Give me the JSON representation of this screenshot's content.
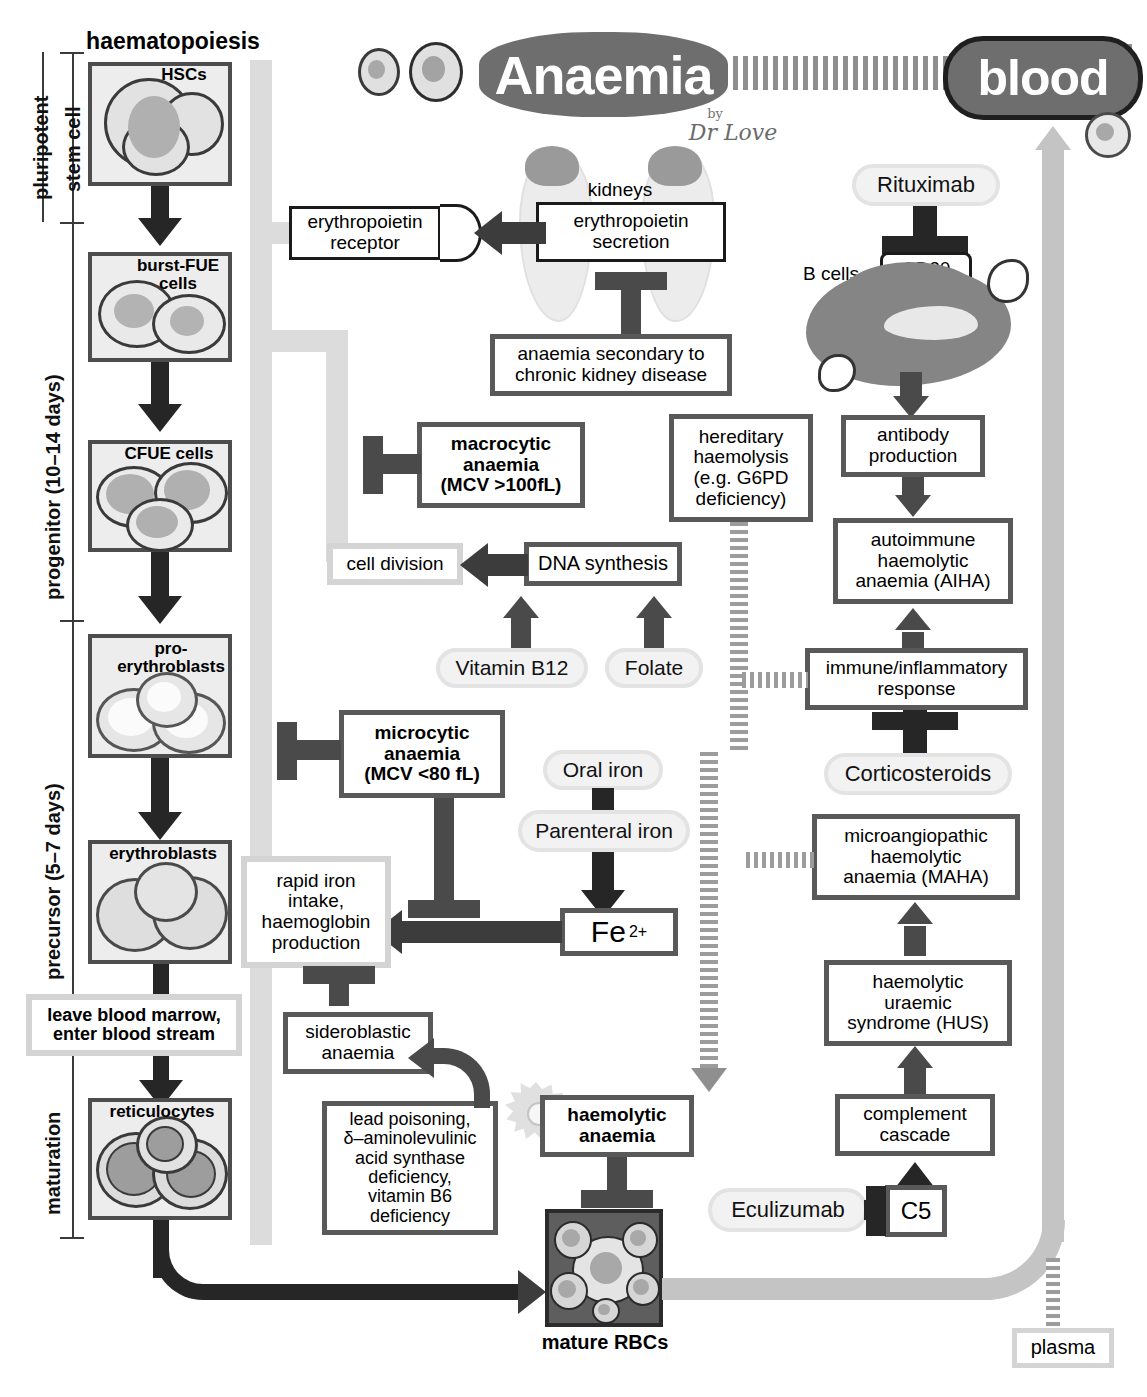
{
  "title": {
    "main": "Anaemia",
    "blood": "blood",
    "byline_small": "by",
    "byline_name": "Dr Love"
  },
  "headers": {
    "haematopoiesis": "haematopoiesis",
    "mature_rbcs": "mature RBCs",
    "plasma": "plasma"
  },
  "stages": [
    {
      "id": "pluripotent",
      "line1": "pluripotent",
      "line2": "stem cell"
    },
    {
      "id": "progenitor",
      "line1": "progenitor (10–14 days)"
    },
    {
      "id": "precursor",
      "line1": "precursor (5–7 days)"
    },
    {
      "id": "maturation",
      "line1": "maturation"
    }
  ],
  "cell_stages": [
    {
      "label": "HSCs"
    },
    {
      "label": "burst-FUE\ncells"
    },
    {
      "label": "CFUE cells"
    },
    {
      "label": "pro-\nerythroblasts"
    },
    {
      "label": "erythroblasts"
    },
    {
      "label": "reticulocytes"
    }
  ],
  "cell_labels": {
    "hscs": "HSCs",
    "burst_fue": "burst-FUE cells",
    "cfue": "CFUE cells",
    "pro_eryth": "pro- erythroblasts",
    "eryth": "erythroblasts",
    "retic": "reticulocytes"
  },
  "boxes": {
    "leave_marrow": "leave blood marrow,\nenter blood stream",
    "epo_receptor": "erythropoietin\nreceptor",
    "epo_secretion": "erythropoietin\nsecretion",
    "kidneys": "kidneys",
    "ckd": "anaemia secondary to\nchronic kidney disease",
    "macrocytic": "macrocytic\nanaemia\n(MCV >100fL)",
    "cell_division": "cell division",
    "dna_synthesis": "DNA synthesis",
    "vitamin_b12": "Vitamin B12",
    "folate": "Folate",
    "microcytic": "microcytic\nanaemia\n(MCV <80 fL)",
    "oral_iron": "Oral iron",
    "parenteral_iron": "Parenteral iron",
    "fe2": "Fe 2+",
    "rapid_iron": "rapid iron\nintake,\nhaemoglobin\nproduction",
    "sideroblastic": "sideroblastic\nanaemia",
    "lead_poisoning": "lead poisoning,\nδ–aminolevulinic\nacid synthase\ndeficiency,\nvitamin B6\ndeficiency",
    "haemolytic": "haemolytic\nanaemia",
    "hereditary": "hereditary\nhaemolysis\n(e.g. G6PD\ndeficiency)",
    "rituximab": "Rituximab",
    "cd20": "CD20",
    "b_cells": "B cells",
    "antibody": "antibody\nproduction",
    "aiha": "autoimmune\nhaemolytic\nanaemia (AIHA)",
    "immune_response": "immune/inflammatory\nresponse",
    "corticosteroids": "Corticosteroids",
    "maha": "microangiopathic\nhaemolytic\nanaemia (MAHA)",
    "hus": "haemolytic\nuraemic\nsyndrome (HUS)",
    "complement": "complement\ncascade",
    "eculizumab": "Eculizumab",
    "c5": "C5"
  },
  "superscripts": {
    "fe_label": "Fe",
    "fe_charge": "2+"
  },
  "colors": {
    "brand_gray": "#6e6e6e",
    "box_border": "#595959",
    "arrow_dark": "#262626",
    "arrow_mid": "#4a4a4a",
    "pale": "#dcdcdc",
    "cell_fill": "#ededed",
    "nucleus": "#a8a8a8"
  }
}
